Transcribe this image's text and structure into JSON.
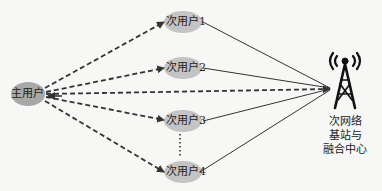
{
  "diagram": {
    "primary_user": {
      "label": "主用户"
    },
    "secondary_users": [
      {
        "label": "次用户1"
      },
      {
        "label": "次用户2"
      },
      {
        "label": "次用户3"
      },
      {
        "label": "次用户4"
      }
    ],
    "fusion_center": {
      "lines": [
        "次网络",
        "基站与",
        "融合中心"
      ],
      "icon": "radio-tower-icon"
    },
    "colors": {
      "ellipse_fill": "#b8b8b8",
      "primary_fill": "#a9a9a9",
      "line": "#333333"
    }
  }
}
